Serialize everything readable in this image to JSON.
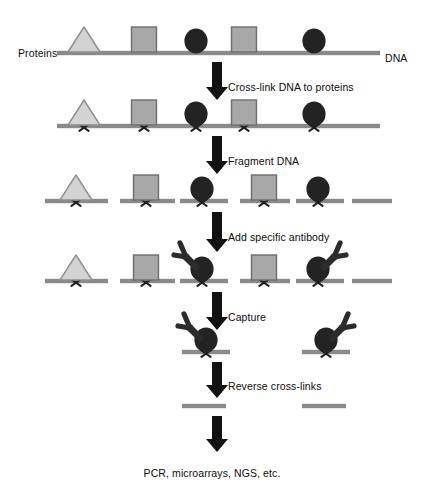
{
  "figure": {
    "type": "process-flow-diagram"
  },
  "labels": {
    "proteins": "Proteins",
    "dna": "DNA",
    "step1": "Cross-link DNA to proteins",
    "step2": "Fragment DNA",
    "step3": "Add specific antibody",
    "step4": "Capture",
    "step5": "Reverse cross-links",
    "outcome": "PCR, microarrays, NGS, etc."
  },
  "colors": {
    "dna_strand": "#8a8a8a",
    "light_protein_fill": "#d3d3d3",
    "light_protein_stroke": "#8f8f8f",
    "mid_protein_fill": "#a8a8a8",
    "mid_protein_stroke": "#6e6e6e",
    "dark_protein": "#232323",
    "antibody": "#2b2b2b",
    "arrow": "#121212",
    "crosslink": "#1d1d1d",
    "text": "#0d0d0d",
    "background": "#ffffff"
  },
  "rows": [
    {
      "name": "row-intact-chromatin",
      "caption_left": "Proteins",
      "caption_right": "DNA",
      "baseline_y": 53,
      "dna_segments": [
        {
          "x1": 57,
          "x2": 380
        }
      ],
      "crosslinks": [],
      "proteins": [
        {
          "shape": "triangle",
          "tone": "light",
          "cx": 84
        },
        {
          "shape": "square",
          "tone": "mid",
          "cx": 144
        },
        {
          "shape": "circle",
          "tone": "dark",
          "cx": 196
        },
        {
          "shape": "square",
          "tone": "mid",
          "cx": 244
        },
        {
          "shape": "circle",
          "tone": "dark",
          "cx": 314
        }
      ],
      "antibodies": []
    },
    {
      "name": "row-crosslinked",
      "baseline_y": 126,
      "dna_segments": [
        {
          "x1": 57,
          "x2": 380
        }
      ],
      "crosslinks": [
        84,
        144,
        196,
        244,
        314
      ],
      "proteins": [
        {
          "shape": "triangle",
          "tone": "light",
          "cx": 84
        },
        {
          "shape": "square",
          "tone": "mid",
          "cx": 144
        },
        {
          "shape": "circle",
          "tone": "dark",
          "cx": 196
        },
        {
          "shape": "square",
          "tone": "mid",
          "cx": 244
        },
        {
          "shape": "circle",
          "tone": "dark",
          "cx": 314
        }
      ],
      "antibodies": []
    },
    {
      "name": "row-fragmented",
      "baseline_y": 201,
      "dna_segments": [
        {
          "x1": 45,
          "x2": 108
        },
        {
          "x1": 120,
          "x2": 175
        },
        {
          "x1": 180,
          "x2": 228
        },
        {
          "x1": 240,
          "x2": 290
        },
        {
          "x1": 296,
          "x2": 344
        },
        {
          "x1": 352,
          "x2": 392
        }
      ],
      "crosslinks": [
        76,
        146,
        202,
        264,
        318
      ],
      "proteins": [
        {
          "shape": "triangle",
          "tone": "light",
          "cx": 76
        },
        {
          "shape": "square",
          "tone": "mid",
          "cx": 146
        },
        {
          "shape": "circle",
          "tone": "dark",
          "cx": 202
        },
        {
          "shape": "square",
          "tone": "mid",
          "cx": 264
        },
        {
          "shape": "circle",
          "tone": "dark",
          "cx": 318
        }
      ],
      "antibodies": []
    },
    {
      "name": "row-antibody-added",
      "baseline_y": 281,
      "dna_segments": [
        {
          "x1": 45,
          "x2": 108
        },
        {
          "x1": 120,
          "x2": 175
        },
        {
          "x1": 180,
          "x2": 228
        },
        {
          "x1": 240,
          "x2": 290
        },
        {
          "x1": 296,
          "x2": 344
        },
        {
          "x1": 352,
          "x2": 392
        }
      ],
      "crosslinks": [
        76,
        146,
        202,
        264,
        318
      ],
      "proteins": [
        {
          "shape": "triangle",
          "tone": "light",
          "cx": 76
        },
        {
          "shape": "square",
          "tone": "mid",
          "cx": 146
        },
        {
          "shape": "circle",
          "tone": "dark",
          "cx": 202
        },
        {
          "shape": "square",
          "tone": "mid",
          "cx": 264
        },
        {
          "shape": "circle",
          "tone": "dark",
          "cx": 318
        }
      ],
      "antibodies": [
        {
          "cx": 202,
          "facing": "left"
        },
        {
          "cx": 318,
          "facing": "right"
        }
      ]
    },
    {
      "name": "row-captured",
      "baseline_y": 352,
      "dna_segments": [
        {
          "x1": 182,
          "x2": 230
        },
        {
          "x1": 302,
          "x2": 350
        }
      ],
      "crosslinks": [
        206,
        326
      ],
      "proteins": [
        {
          "shape": "circle",
          "tone": "dark",
          "cx": 206
        },
        {
          "shape": "circle",
          "tone": "dark",
          "cx": 326
        }
      ],
      "antibodies": [
        {
          "cx": 206,
          "facing": "left"
        },
        {
          "cx": 326,
          "facing": "right"
        }
      ]
    },
    {
      "name": "row-purified-dna",
      "baseline_y": 406,
      "dna_segments": [
        {
          "x1": 182,
          "x2": 226
        },
        {
          "x1": 302,
          "x2": 346
        }
      ],
      "crosslinks": [],
      "proteins": [],
      "antibodies": []
    }
  ],
  "arrows": [
    {
      "name": "arrow-crosslink",
      "x": 217,
      "y1": 62,
      "y2": 100,
      "label": "Cross-link DNA to proteins",
      "label_x": 228,
      "label_y": 81
    },
    {
      "name": "arrow-fragment",
      "x": 217,
      "y1": 136,
      "y2": 174,
      "label": "Fragment DNA",
      "label_x": 228,
      "label_y": 155
    },
    {
      "name": "arrow-add-antibody",
      "x": 217,
      "y1": 212,
      "y2": 252,
      "label": "Add specific antibody",
      "label_x": 228,
      "label_y": 231
    },
    {
      "name": "arrow-capture",
      "x": 217,
      "y1": 292,
      "y2": 330,
      "label": "Capture",
      "label_x": 228,
      "label_y": 311
    },
    {
      "name": "arrow-reverse",
      "x": 217,
      "y1": 362,
      "y2": 398,
      "label": "Reverse cross-links",
      "label_x": 228,
      "label_y": 380
    },
    {
      "name": "arrow-to-analysis",
      "x": 217,
      "y1": 416,
      "y2": 452,
      "label": "",
      "label_x": 0,
      "label_y": 0
    }
  ],
  "captions": {
    "proteins_x": 18,
    "proteins_y": 47,
    "dna_x": 385,
    "dna_y": 52,
    "outcome_x": 212,
    "outcome_y": 467
  }
}
